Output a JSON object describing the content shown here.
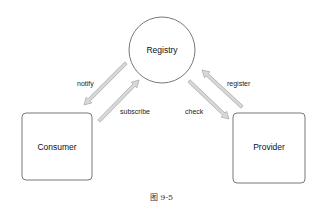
{
  "nodes": {
    "registry": "Registry",
    "consumer": "Consumer",
    "provider": "Provider"
  },
  "edges": {
    "notify": "notify",
    "subscribe": "subscribe",
    "check": "check",
    "register": "register"
  },
  "caption": "图 9-5",
  "colors": {
    "stroke": "#444444",
    "arrow_fill": "#d8d8d8",
    "arrow_stroke": "#999999"
  }
}
